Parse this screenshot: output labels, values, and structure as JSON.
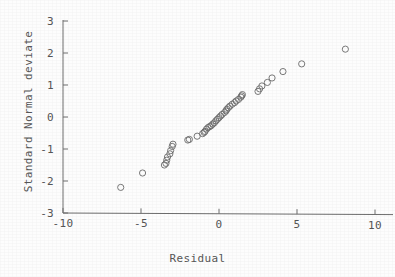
{
  "figure": {
    "background_color": "#fdfdfd",
    "ink_color": "#6b6b6b",
    "text_color": "#555555"
  },
  "chart_data": {
    "type": "scatter",
    "title": "",
    "subtitle": "",
    "xlabel": "Residual",
    "ylabel": "Standard Normal deviate",
    "xlim": [
      -10,
      10
    ],
    "ylim": [
      -3,
      3
    ],
    "xticks": [
      -10,
      -5,
      0,
      5,
      10
    ],
    "xticklabels": [
      "-10",
      "-5",
      "0",
      "5",
      "10"
    ],
    "yticks": [
      -3,
      -2,
      -1,
      0,
      1,
      2,
      3
    ],
    "yticklabels": [
      "-3",
      "-2",
      "-1",
      "0",
      "1",
      "2",
      "3"
    ],
    "grid": false,
    "legend": null,
    "legend_position": "none",
    "marker": "open-circle",
    "marker_size": 4,
    "annotations": [],
    "series": [
      {
        "name": "residual quantiles",
        "x": [
          -6.3,
          -4.9,
          -3.5,
          -3.4,
          -3.35,
          -3.3,
          -3.15,
          -3.1,
          -3.0,
          -2.95,
          -2.0,
          -1.9,
          -1.4,
          -1.05,
          -0.95,
          -0.9,
          -0.8,
          -0.7,
          -0.6,
          -0.5,
          -0.4,
          -0.3,
          -0.2,
          -0.1,
          0.0,
          0.1,
          0.2,
          0.35,
          0.45,
          0.5,
          0.6,
          0.7,
          0.85,
          1.0,
          1.1,
          1.25,
          1.4,
          1.45,
          1.5,
          2.5,
          2.6,
          2.75,
          3.1,
          3.4,
          4.1,
          5.3,
          8.1
        ],
        "y": [
          -2.2,
          -1.75,
          -1.5,
          -1.45,
          -1.35,
          -1.25,
          -1.15,
          -1.05,
          -0.92,
          -0.85,
          -0.72,
          -0.7,
          -0.6,
          -0.52,
          -0.48,
          -0.45,
          -0.38,
          -0.33,
          -0.3,
          -0.27,
          -0.22,
          -0.18,
          -0.12,
          -0.07,
          -0.02,
          0.03,
          0.08,
          0.14,
          0.19,
          0.24,
          0.29,
          0.34,
          0.4,
          0.45,
          0.5,
          0.55,
          0.62,
          0.66,
          0.7,
          0.8,
          0.88,
          0.97,
          1.08,
          1.22,
          1.42,
          1.66,
          2.12
        ]
      }
    ]
  }
}
